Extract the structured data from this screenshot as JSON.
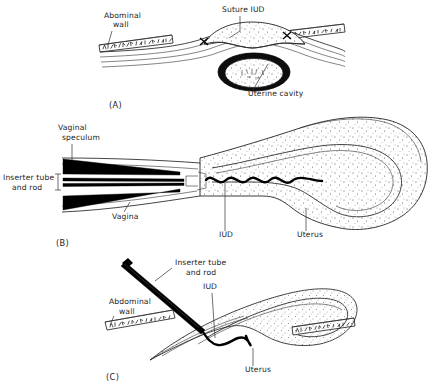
{
  "figure": {
    "background_color": "#ffffff",
    "ink_color": "#1b1b1b",
    "panels": [
      {
        "id": "A",
        "letter": "(A)",
        "description": "Transabdominal view of uterus with suture IUD at fundus",
        "labels": [
          {
            "name": "abdominal-wall",
            "text_line1": "Abominal",
            "text_line2": "wall"
          },
          {
            "name": "suture-iud",
            "text_line1": "Suture IUD",
            "text_line2": ""
          },
          {
            "name": "uterine-cavity",
            "text_line1": "Uterine cavity",
            "text_line2": ""
          }
        ]
      },
      {
        "id": "B",
        "letter": "(B)",
        "description": "Sagittal view of inserter tube and rod passing through vaginal speculum into uterus",
        "labels": [
          {
            "name": "vaginal-speculum",
            "text_line1": "Vaginal",
            "text_line2": "speculum"
          },
          {
            "name": "inserter-tube-and-rod",
            "text_line1": "Inserter tube",
            "text_line2": "and rod"
          },
          {
            "name": "vagina",
            "text_line1": "Vagina",
            "text_line2": ""
          },
          {
            "name": "iud",
            "text_line1": "IUD",
            "text_line2": ""
          },
          {
            "name": "uterus",
            "text_line1": "Uterus",
            "text_line2": ""
          }
        ]
      },
      {
        "id": "C",
        "letter": "(C)",
        "description": "Transabdominal insertion of IUD into uterine fundus through abdominal wall",
        "labels": [
          {
            "name": "inserter-tube-and-rod",
            "text_line1": "Inserter tube",
            "text_line2": "and rod"
          },
          {
            "name": "iud",
            "text_line1": "IUD",
            "text_line2": ""
          },
          {
            "name": "abdominal-wall",
            "text_line1": "Abdominal",
            "text_line2": "wall"
          },
          {
            "name": "uterus",
            "text_line1": "Uterus",
            "text_line2": ""
          }
        ]
      }
    ]
  }
}
